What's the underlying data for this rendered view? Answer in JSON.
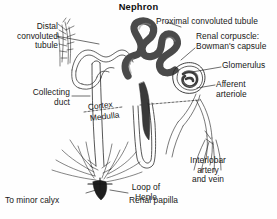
{
  "figure": {
    "title": "Nephron",
    "background_color": "#fefefe",
    "ink_color": "#1a1a1a"
  },
  "labels": {
    "distal_convoluted_tubule": "Distal\nconvoluted\ntubule",
    "collecting_duct": "Collecting\nduct",
    "cortex": "Cortex",
    "medulla": "Medulla",
    "to_minor_calyx": "To minor calyx",
    "renal_papilla": "Renal papilla",
    "loop_of_henle": "Loop of\nHenle",
    "proximal_convoluted_tubule": "Proximal convoluted tubule",
    "renal_corpuscle": "Renal corpuscle:\nBowman's capsule",
    "glomerulus": "Glomerulus",
    "afferent_arteriole": "Afferent\narteriole",
    "interlobar_vessels": "Interlobar\nartery\nand vein"
  },
  "structures": [
    {
      "name": "proximal-convoluted-tubule",
      "style": "thick dark coiled serpentine tubule",
      "fill": "#4a4a4a"
    },
    {
      "name": "renal-corpuscle",
      "style": "spiral capillary ball within capsule",
      "fill": "#3d3d3d"
    },
    {
      "name": "distal-convoluted-tubule",
      "style": "thin wavy outlined tubule"
    },
    {
      "name": "collecting-duct",
      "style": "long vertical double-line duct"
    },
    {
      "name": "loop-of-henle",
      "style": "thin U-shaped tube descending into medulla"
    },
    {
      "name": "thick-descending-limb",
      "style": "dark tapering wedge",
      "fill": "#3a3a3a"
    },
    {
      "name": "renal-papilla",
      "style": "dark triangular tip with radiating ducts",
      "fill": "#1f1f1f"
    },
    {
      "name": "interlobar-vessels",
      "style": "branching fine vessel lines"
    },
    {
      "name": "cortex-medulla-boundary",
      "style": "dashed divider line"
    }
  ]
}
